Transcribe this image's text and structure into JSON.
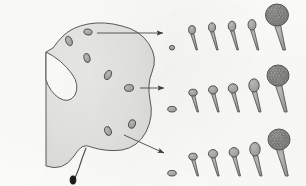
{
  "figure": {
    "caption": "",
    "background_color": "#fdfdfb",
    "ink_color": "#4a4a48",
    "body_fill_color": "#e6e6e3",
    "cell_fill_color": "#a8a8a4",
    "sporangium_fill_color": "#9e9e9a",
    "stalk_tip_color": "#1a1a18",
    "line_width": 0.9
  },
  "plasmodium": {
    "label": "plasmodium-body",
    "outline_path": "M 46,52 L 46,166 Q 63,172 74,156 Q 82,142 91,147 Q 106,152 122,150 Q 138,147 146,132 Q 154,116 150,100 Q 147,84 152,72 Q 158,58 149,44 Q 140,30 122,26 Q 104,21 88,24 Q 72,27 63,36 Q 57,42 53,48 Z",
    "cleft_path": "M 46,52 Q 62,60 72,74 Q 80,85 75,95 Q 69,104 59,98 Q 50,92 46,80 Z",
    "foot_stalk_path": "M 86,148 Q 82,158 79,168 Q 76,176 74,180",
    "foot_tip": {
      "cx": 73,
      "cy": 180,
      "rx": 3.0,
      "ry": 4.2
    },
    "embedded_cells": [
      {
        "cx": 69,
        "cy": 41,
        "rx": 3.1,
        "ry": 5.0,
        "rot": -22
      },
      {
        "cx": 88,
        "cy": 32,
        "rx": 4.2,
        "ry": 3.0,
        "rot": 12
      },
      {
        "cx": 87,
        "cy": 58,
        "rx": 3.0,
        "ry": 4.6,
        "rot": -14
      },
      {
        "cx": 108,
        "cy": 75,
        "rx": 3.2,
        "ry": 5.0,
        "rot": 28
      },
      {
        "cx": 129,
        "cy": 88,
        "rx": 4.6,
        "ry": 3.4,
        "rot": -6
      },
      {
        "cx": 132,
        "cy": 124,
        "rx": 3.4,
        "ry": 4.4,
        "rot": 18
      },
      {
        "cx": 108,
        "cy": 131,
        "rx": 3.2,
        "ry": 4.6,
        "rot": -20
      }
    ]
  },
  "arrows": [
    {
      "name": "arrow-to-row-1",
      "x1": 97,
      "y1": 33,
      "x2": 163,
      "y2": 33
    },
    {
      "name": "arrow-to-row-2",
      "x1": 140,
      "y1": 88,
      "x2": 164,
      "y2": 88
    },
    {
      "name": "arrow-to-row-3",
      "x1": 124,
      "y1": 135,
      "x2": 164,
      "y2": 153
    }
  ],
  "sequences": [
    {
      "name": "development-row-1",
      "row_index": 1,
      "baseline_y": 50,
      "stage_count": 6,
      "stages": [
        {
          "index": 1,
          "label": "undifferentiated-cell",
          "x": 172,
          "head_rx": 2.6,
          "head_ry": 2.3,
          "stalk_len": 0,
          "stalk_w": 0,
          "reticulate": false
        },
        {
          "index": 2,
          "label": "early-stalk",
          "x": 192,
          "head_rx": 3.4,
          "head_ry": 4.2,
          "stalk_len": 16,
          "stalk_w": 1.6,
          "reticulate": false
        },
        {
          "index": 3,
          "label": "elongating-stalk",
          "x": 212,
          "head_rx": 3.6,
          "head_ry": 4.6,
          "stalk_len": 18,
          "stalk_w": 1.7,
          "reticulate": false
        },
        {
          "index": 4,
          "label": "pre-sporangium",
          "x": 232,
          "head_rx": 3.8,
          "head_ry": 4.9,
          "stalk_len": 19,
          "stalk_w": 1.8,
          "reticulate": false
        },
        {
          "index": 5,
          "label": "swelling-sporangium",
          "x": 252,
          "head_rx": 4.0,
          "head_ry": 5.2,
          "stalk_len": 20,
          "stalk_w": 1.9,
          "reticulate": false
        },
        {
          "index": 6,
          "label": "mature-sporangium",
          "x": 277,
          "head_rx": 11.5,
          "head_ry": 11.0,
          "stalk_len": 24,
          "stalk_w": 3.2,
          "reticulate": true
        }
      ]
    },
    {
      "name": "development-row-2",
      "row_index": 2,
      "baseline_y": 112,
      "stage_count": 6,
      "stages": [
        {
          "index": 1,
          "label": "undifferentiated-cell",
          "x": 172,
          "head_rx": 4.3,
          "head_ry": 2.8,
          "stalk_len": 0,
          "stalk_w": 0,
          "reticulate": false
        },
        {
          "index": 2,
          "label": "early-stalk",
          "x": 193,
          "head_rx": 4.2,
          "head_ry": 3.4,
          "stalk_len": 16,
          "stalk_w": 1.7,
          "reticulate": false
        },
        {
          "index": 3,
          "label": "elongating-stalk",
          "x": 213,
          "head_rx": 4.5,
          "head_ry": 4.1,
          "stalk_len": 18,
          "stalk_w": 1.8,
          "reticulate": false
        },
        {
          "index": 4,
          "label": "pre-sporangium",
          "x": 233,
          "head_rx": 4.8,
          "head_ry": 4.6,
          "stalk_len": 19,
          "stalk_w": 1.9,
          "reticulate": false
        },
        {
          "index": 5,
          "label": "swelling-sporangium",
          "x": 254,
          "head_rx": 5.2,
          "head_ry": 6.6,
          "stalk_len": 20,
          "stalk_w": 2.4,
          "reticulate": false
        },
        {
          "index": 6,
          "label": "mature-sporangium",
          "x": 278,
          "head_rx": 11.0,
          "head_ry": 10.5,
          "stalk_len": 26,
          "stalk_w": 3.4,
          "reticulate": true
        }
      ]
    },
    {
      "name": "development-row-3",
      "row_index": 3,
      "baseline_y": 176,
      "stage_count": 6,
      "stages": [
        {
          "index": 1,
          "label": "undifferentiated-cell",
          "x": 172,
          "head_rx": 4.3,
          "head_ry": 2.8,
          "stalk_len": 0,
          "stalk_w": 0,
          "reticulate": false
        },
        {
          "index": 2,
          "label": "early-stalk",
          "x": 193,
          "head_rx": 4.2,
          "head_ry": 3.4,
          "stalk_len": 16,
          "stalk_w": 1.7,
          "reticulate": false
        },
        {
          "index": 3,
          "label": "elongating-stalk",
          "x": 213,
          "head_rx": 4.6,
          "head_ry": 4.2,
          "stalk_len": 18,
          "stalk_w": 1.8,
          "reticulate": false
        },
        {
          "index": 4,
          "label": "pre-sporangium",
          "x": 234,
          "head_rx": 4.9,
          "head_ry": 4.7,
          "stalk_len": 19,
          "stalk_w": 1.9,
          "reticulate": false
        },
        {
          "index": 5,
          "label": "swelling-sporangium",
          "x": 255,
          "head_rx": 5.2,
          "head_ry": 6.8,
          "stalk_len": 20,
          "stalk_w": 2.5,
          "reticulate": false
        },
        {
          "index": 6,
          "label": "mature-sporangium",
          "x": 279,
          "head_rx": 11.0,
          "head_ry": 10.5,
          "stalk_len": 26,
          "stalk_w": 3.4,
          "reticulate": true
        }
      ]
    }
  ]
}
